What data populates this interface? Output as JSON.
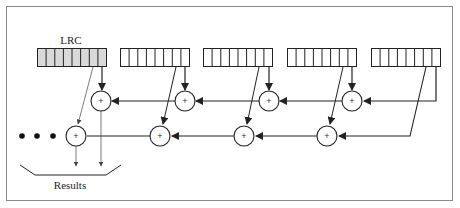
{
  "diagram": {
    "type": "LRC (longitudinal redundancy check) XOR computation",
    "lrc_label": "LRC",
    "results_label": "Results",
    "ellipsis": "• • •",
    "xor_symbol": "+",
    "colors": {
      "frame": "#8a8a8a",
      "lrc_fill": "#d9d9d9",
      "register_fill": "#ffffff",
      "stroke": "#222222"
    },
    "registers": [
      {
        "name": "LRC",
        "x": 37,
        "cells": 8,
        "shaded": true
      },
      {
        "name": "byte-1",
        "x": 120,
        "cells": 8,
        "shaded": false
      },
      {
        "name": "byte-2",
        "x": 203,
        "cells": 8,
        "shaded": false
      },
      {
        "name": "byte-3",
        "x": 287,
        "cells": 8,
        "shaded": false
      },
      {
        "name": "byte-4",
        "x": 371,
        "cells": 8,
        "shaded": false
      }
    ],
    "xor_top_row": [
      101,
      185,
      269,
      352
    ],
    "xor_bottom_row": [
      76,
      160,
      244,
      327
    ]
  }
}
